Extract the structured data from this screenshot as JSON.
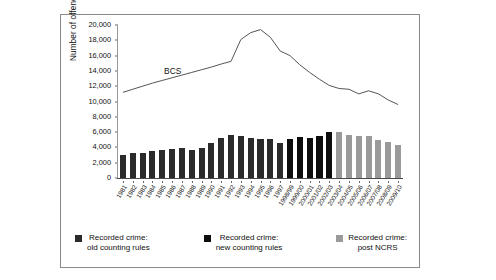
{
  "chart_data": {
    "type": "bar",
    "title": "",
    "subtitle": "",
    "xlabel": "",
    "ylabel": "Number of offences (000s)",
    "ylim": [
      0,
      20000
    ],
    "ytick_values": [
      0,
      2000,
      4000,
      6000,
      8000,
      10000,
      12000,
      14000,
      16000,
      18000,
      20000
    ],
    "ytick_labels": [
      "0",
      "2,000",
      "4,000",
      "6,000",
      "8,000",
      "10,000",
      "12,000",
      "14,000",
      "16,000",
      "18,000",
      "20,000"
    ],
    "grid": false,
    "legend_position": "bottom",
    "categories": [
      "1981",
      "1982",
      "1983",
      "1984",
      "1985",
      "1986",
      "1987",
      "1988",
      "1989",
      "1990",
      "1991",
      "1992",
      "1993",
      "1994",
      "1995",
      "1996",
      "1997",
      "1998/99",
      "1999/00",
      "2000/01",
      "2001/02",
      "2002/03",
      "2003/04",
      "2004/05",
      "2005/06",
      "2006/07",
      "2007/08",
      "2008/09",
      "2009/10"
    ],
    "series": [
      {
        "name": "Recorded crime: old counting rules",
        "type": "bar",
        "color": "#2b2b2b",
        "values": [
          2964,
          3262,
          3247,
          3499,
          3612,
          3847,
          3892,
          3716,
          3870,
          4544,
          5276,
          5592,
          5527,
          5253,
          5100,
          5037,
          4598,
          null,
          null,
          null,
          null,
          null,
          null,
          null,
          null,
          null,
          null,
          null,
          null
        ]
      },
      {
        "name": "Recorded crime: new counting rules",
        "type": "bar",
        "color": "#0d0d0d",
        "values": [
          null,
          null,
          null,
          null,
          null,
          null,
          null,
          null,
          null,
          null,
          null,
          null,
          null,
          null,
          null,
          null,
          4598,
          5109,
          5301,
          5171,
          5525,
          5975,
          null,
          null,
          null,
          null,
          null,
          null,
          null
        ]
      },
      {
        "name": "Recorded crime: post NCRS",
        "type": "bar",
        "color": "#9a9a9a",
        "values": [
          null,
          null,
          null,
          null,
          null,
          null,
          null,
          null,
          null,
          null,
          null,
          null,
          null,
          null,
          null,
          null,
          null,
          null,
          null,
          null,
          null,
          5975,
          6014,
          5637,
          5555,
          5428,
          4951,
          4703,
          4338
        ]
      },
      {
        "name": "BCS",
        "type": "line",
        "color": "#555555",
        "values": [
          11200,
          11600,
          12000,
          12400,
          12750,
          13100,
          13450,
          13800,
          14150,
          14500,
          14900,
          15250,
          18100,
          19000,
          19400,
          18400,
          16600,
          16000,
          14800,
          13800,
          12900,
          12100,
          11700,
          11600,
          11000,
          11400,
          11000,
          10200,
          9600
        ]
      }
    ],
    "annotations": [
      {
        "text": "BCS",
        "category": "1986",
        "value": 13900
      }
    ],
    "legend": [
      {
        "label": "Recorded crime:\nold counting rules",
        "color": "#2b2b2b",
        "swatch": "dark-square"
      },
      {
        "label": "Recorded crime:\nnew counting rules",
        "color": "#0d0d0d",
        "swatch": "black-square"
      },
      {
        "label": "Recorded crime:\npost NCRS",
        "color": "#9a9a9a",
        "swatch": "gray-square"
      }
    ]
  }
}
